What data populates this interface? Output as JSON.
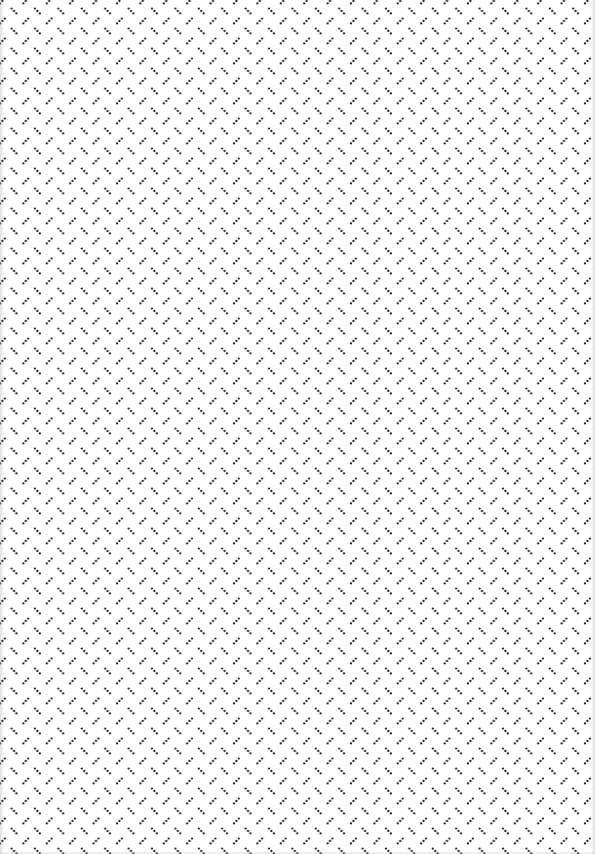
{
  "pattern": {
    "name": "diamond-plate dotted texture",
    "background_color": "#ffffff",
    "dot_color": "#222222",
    "tile_width": 23.4,
    "tile_height": 20,
    "dots_per_dash": 3,
    "dash_orientations": [
      "backslash",
      "slash"
    ]
  }
}
